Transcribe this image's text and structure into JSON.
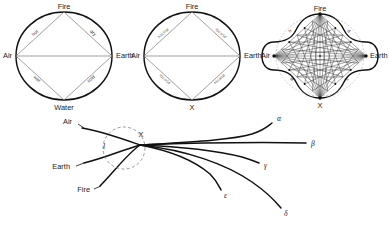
{
  "figure": {
    "background": "#ffffff",
    "ink": "#111111"
  },
  "diagram1": {
    "name": "classical-square-of-elements",
    "center": {
      "x": 64,
      "y": 56
    },
    "radius_x": 48,
    "radius_y": 44,
    "vertices": [
      {
        "id": "top",
        "label": "Fire",
        "x": 64,
        "y": 12
      },
      {
        "id": "left",
        "label": "Air",
        "x": 16,
        "y": 56
      },
      {
        "id": "right",
        "label": "Earth",
        "x": 112,
        "y": 56
      },
      {
        "id": "bottom",
        "label": "Water",
        "x": 64,
        "y": 100
      }
    ],
    "edges": [
      {
        "from": "left",
        "to": "top",
        "label": "hot"
      },
      {
        "from": "top",
        "to": "right",
        "label": "dry"
      },
      {
        "from": "left",
        "to": "bottom",
        "label": "wet"
      },
      {
        "from": "bottom",
        "to": "right",
        "label": "cold"
      }
    ]
  },
  "diagram2": {
    "name": "square-of-elements-with-X",
    "center": {
      "x": 192,
      "y": 56
    },
    "radius_x": 48,
    "radius_y": 44,
    "vertices": [
      {
        "id": "top",
        "label": "Fire",
        "x": 192,
        "y": 12
      },
      {
        "id": "left",
        "label": "Air",
        "x": 144,
        "y": 56
      },
      {
        "id": "right",
        "label": "Earth",
        "x": 240,
        "y": 56
      },
      {
        "id": "bottom",
        "label": "X",
        "x": 192,
        "y": 100
      }
    ],
    "edges": [
      {
        "from": "left",
        "to": "top",
        "label": "h1c,h1d"
      },
      {
        "from": "top",
        "to": "right",
        "label": "h1c,w1d"
      },
      {
        "from": "left",
        "to": "bottom",
        "label": "h1c,w1d"
      },
      {
        "from": "bottom",
        "to": "right",
        "label": "h1c,w1d"
      }
    ]
  },
  "diagram3": {
    "name": "complete-graph-scalloped-diagram",
    "center": {
      "x": 320,
      "y": 56
    },
    "radius_x": 50,
    "radius_y": 46,
    "vertices": [
      {
        "id": "top",
        "label": "Fire",
        "x": 320,
        "y": 14
      },
      {
        "id": "left",
        "label": "Air",
        "x": 274,
        "y": 56
      },
      {
        "id": "right",
        "label": "Earth",
        "x": 366,
        "y": 56
      },
      {
        "id": "bottom",
        "label": "X",
        "x": 320,
        "y": 98
      }
    ],
    "edge_labels": [
      {
        "label": "h",
        "x": 291,
        "y": 32
      },
      {
        "label": "d",
        "x": 348,
        "y": 32
      },
      {
        "label": "w",
        "x": 291,
        "y": 80
      },
      {
        "label": "c",
        "x": 348,
        "y": 80
      }
    ],
    "subdivisions_per_edge": 5
  },
  "diagram4": {
    "name": "convergence-fan",
    "focus": {
      "label": "X",
      "x": 140,
      "y": 145
    },
    "dashed_circle": {
      "cx": 124,
      "cy": 148,
      "r": 21
    },
    "side_label": {
      "label": "l",
      "x": 104,
      "y": 146
    },
    "inputs": [
      {
        "label": "Air",
        "label_x": 72,
        "label_y": 125,
        "start_x": 82,
        "start_y": 128
      },
      {
        "label": "Earth",
        "label_x": 66,
        "label_y": 166,
        "start_x": 84,
        "start_y": 163
      },
      {
        "label": "Fire",
        "label_x": 84,
        "label_y": 189,
        "start_x": 100,
        "start_y": 186
      }
    ],
    "outputs": [
      {
        "label": "α",
        "label_x": 276,
        "label_y": 119,
        "end_x": 272,
        "end_y": 123
      },
      {
        "label": "β",
        "label_x": 313,
        "label_y": 145,
        "end_x": 306,
        "end_y": 143
      },
      {
        "label": "γ",
        "label_x": 265,
        "label_y": 166,
        "end_x": 259,
        "end_y": 163
      },
      {
        "label": "ε",
        "label_x": 225,
        "label_y": 196,
        "end_x": 221,
        "end_y": 190
      },
      {
        "label": "δ",
        "label_x": 285,
        "label_y": 214,
        "end_x": 281,
        "end_y": 208
      }
    ]
  }
}
